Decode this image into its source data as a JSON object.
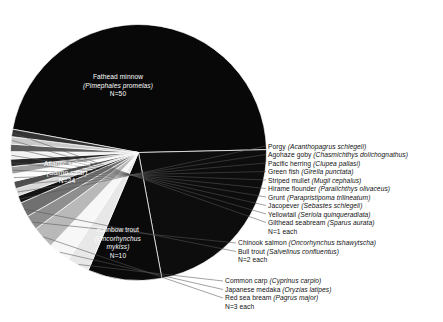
{
  "chart_data": {
    "type": "pie",
    "title": "",
    "xlabel": "",
    "ylabel": "",
    "legend_position": "callout-labels",
    "grid": false,
    "total": 107,
    "units": "N (number of studies)",
    "categories": [
      "Fathead minnow (Pimephales promelas)",
      "Atlantic salmon (Salmo salar)",
      "Rainbow trout (Oncorhynchus mykiss)",
      "Common carp (Cyprinus carpio)",
      "Japanese medaka (Oryzias latipes)",
      "Red sea bream (Pagrus major)",
      "Chinook salmon (Oncorhynchus tshawytscha)",
      "Bull trout (Salvelinus confluentus)",
      "Porgy (Acanthopagrus schlegeli)",
      "Agohaze goby (Chasmichthys dolichognathus)",
      "Pacific herring (Clupea pallasi)",
      "Green fish (Girella punctata)",
      "Striped mullet (Mugil cephalus)",
      "Hirame flounder (Paralichthys olivaceus)",
      "Grunt (Parapristipoma trilineatum)",
      "Jacopever (Sebastes schlegeli)",
      "Yellowtail (Seriola quinqueradiata)",
      "Gilthead seabream (Sparus aurata)"
    ],
    "values": [
      50,
      24,
      10,
      3,
      3,
      3,
      2,
      2,
      1,
      1,
      1,
      1,
      1,
      1,
      1,
      1,
      1,
      1
    ],
    "colors": [
      "#080808",
      "#0d0d0d",
      "#0a0a0a",
      "#e8e8e8",
      "#f7f7f7",
      "#b9b9b9",
      "#8f8f8f",
      "#707070",
      "#141414",
      "#d8d8d8",
      "#4e4e4e",
      "#fbfbfb",
      "#9e9e9e",
      "#262626",
      "#f2f2f2",
      "#5c5c5c",
      "#c9c9c9",
      "#333333"
    ]
  },
  "pie_labels": [
    {
      "name": "fathead-minnow",
      "common": "Fathead minnow",
      "scientific": "(Pimephales promelas)",
      "count": "N=50"
    },
    {
      "name": "atlantic-salmon",
      "common": "Atlantic salmon",
      "scientific": "(Salmo salar)",
      "count": "N=24"
    },
    {
      "name": "rainbow-trout",
      "common": "Rainbow trout",
      "scientific1": "(Oncorhynchus",
      "scientific2": "mykiss)",
      "count": "N=10"
    }
  ],
  "callouts": {
    "single": {
      "rows": [
        {
          "common": "Porgy ",
          "sci": "(Acanthopagrus schlegeli)"
        },
        {
          "common": "Agohaze goby ",
          "sci": "(Chasmichthys dolichognathus)"
        },
        {
          "common": "Pacific herring ",
          "sci": "(Clupea pallasi)"
        },
        {
          "common": "Green fish ",
          "sci": "(Girella punctata)"
        },
        {
          "common": "Striped mullet ",
          "sci": "(Mugil cephalus)"
        },
        {
          "common": "Hirame flounder ",
          "sci": "(Paralichthys olivaceus)"
        },
        {
          "common": "Grunt ",
          "sci": "(Parapristipoma trilineatum)"
        },
        {
          "common": "Jacopever ",
          "sci": "(Sebastes schlegeli)"
        },
        {
          "common": "Yellowtail ",
          "sci": "(Seriola quinqueradiata)"
        },
        {
          "common": "Gilthead seabream ",
          "sci": "(Sparus aurata)"
        }
      ],
      "count": "N=1 each"
    },
    "pair": {
      "rows": [
        {
          "common": "Chinook salmon ",
          "sci": "(Oncorhynchus tshawytscha)"
        },
        {
          "common": "Bull trout ",
          "sci": "(Salvelinus confluentus)"
        }
      ],
      "count": "N=2 each"
    },
    "triple": {
      "rows": [
        {
          "common": "Common carp ",
          "sci": "(Cyprinus carpio)"
        },
        {
          "common": "Japanese medaka ",
          "sci": "(Oryzias latipes)"
        },
        {
          "common": "Red sea bream ",
          "sci": "(Pagrus major)"
        }
      ],
      "count": "N=3 each"
    }
  }
}
